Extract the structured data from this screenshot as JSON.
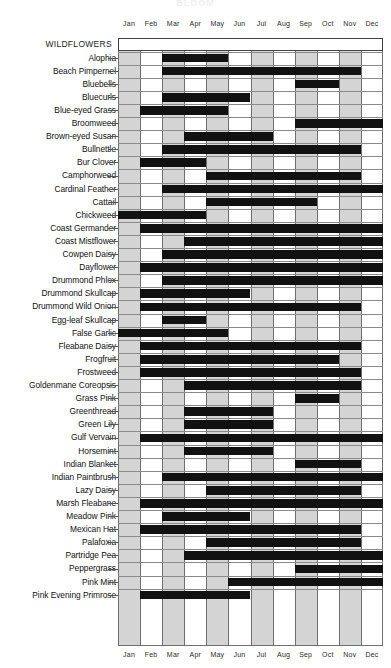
{
  "page": {
    "top_title": "BLOOM",
    "banner_label": "WILDFLOWERS"
  },
  "chart_data": {
    "type": "bar",
    "title": "WILDFLOWERS",
    "subtitle": "Bloom periods by month",
    "xlabel": "",
    "ylabel": "",
    "grid": true,
    "legend": "none",
    "categories": [
      "Jan",
      "Feb",
      "Mar",
      "Apr",
      "May",
      "Jun",
      "Jul",
      "Aug",
      "Sep",
      "Oct",
      "Nov",
      "Dec"
    ],
    "bar_meaning": "Black span = months in bloom",
    "series": [
      {
        "name": "Alophia",
        "start_month": "Mar",
        "end_month": "May",
        "start": 2,
        "end": 5
      },
      {
        "name": "Beach Pimpernel",
        "start_month": "Mar",
        "end_month": "Nov",
        "start": 2,
        "end": 11
      },
      {
        "name": "Bluebells",
        "start_month": "Sep",
        "end_month": "Oct",
        "start": 8,
        "end": 10
      },
      {
        "name": "Bluecurls",
        "start_month": "Mar",
        "end_month": "Jun",
        "start": 2,
        "end": 6
      },
      {
        "name": "Blue-eyed Grass",
        "start_month": "Feb",
        "end_month": "May",
        "start": 1,
        "end": 5
      },
      {
        "name": "Broomweed",
        "start_month": "Sep",
        "end_month": "Dec",
        "start": 8,
        "end": 12
      },
      {
        "name": "Brown-eyed Susan",
        "start_month": "Apr",
        "end_month": "Jul",
        "start": 3,
        "end": 7
      },
      {
        "name": "Bullnettle",
        "start_month": "Mar",
        "end_month": "Nov",
        "start": 2,
        "end": 11
      },
      {
        "name": "Bur Clover",
        "start_month": "Feb",
        "end_month": "Apr",
        "start": 1,
        "end": 4
      },
      {
        "name": "Camphorweed",
        "start_month": "May",
        "end_month": "Nov",
        "start": 4,
        "end": 11
      },
      {
        "name": "Cardinal Feather",
        "start_month": "Mar",
        "end_month": "Dec",
        "start": 2,
        "end": 12
      },
      {
        "name": "Cattail",
        "start_month": "May",
        "end_month": "Sep",
        "start": 4,
        "end": 9
      },
      {
        "name": "Chickweed",
        "start_month": "Jan",
        "end_month": "Apr",
        "start": 0,
        "end": 4
      },
      {
        "name": "Coast Germander",
        "start_month": "Feb",
        "end_month": "Dec",
        "start": 1,
        "end": 12
      },
      {
        "name": "Coast Mistflower",
        "start_month": "Apr",
        "end_month": "Dec",
        "start": 3,
        "end": 12
      },
      {
        "name": "Cowpen Daisy",
        "start_month": "Mar",
        "end_month": "Dec",
        "start": 2,
        "end": 12
      },
      {
        "name": "Dayflower",
        "start_month": "Feb",
        "end_month": "Dec",
        "start": 1,
        "end": 12
      },
      {
        "name": "Drummond Phlox",
        "start_month": "Mar",
        "end_month": "Dec",
        "start": 2,
        "end": 12
      },
      {
        "name": "Drummond Skullcap",
        "start_month": "Feb",
        "end_month": "Jun",
        "start": 1,
        "end": 6
      },
      {
        "name": "Drummond Wild Onion",
        "start_month": "Feb",
        "end_month": "Nov",
        "start": 1,
        "end": 11
      },
      {
        "name": "Egg-leaf Skullcap",
        "start_month": "Mar",
        "end_month": "Apr",
        "start": 2,
        "end": 4
      },
      {
        "name": "False Garlic",
        "start_month": "Jan",
        "end_month": "May",
        "start": 0,
        "end": 5
      },
      {
        "name": "Fleabane Daisy",
        "start_month": "Feb",
        "end_month": "Nov",
        "start": 1,
        "end": 11
      },
      {
        "name": "Frogfruit",
        "start_month": "Feb",
        "end_month": "Oct",
        "start": 1,
        "end": 10
      },
      {
        "name": "Frostweed",
        "start_month": "Feb",
        "end_month": "Nov",
        "start": 1,
        "end": 11
      },
      {
        "name": "Goldenmane Coreopsis",
        "start_month": "Apr",
        "end_month": "Nov",
        "start": 3,
        "end": 11
      },
      {
        "name": "Grass Pink",
        "start_month": "Sep",
        "end_month": "Oct",
        "start": 8,
        "end": 10
      },
      {
        "name": "Greenthread",
        "start_month": "Apr",
        "end_month": "Jul",
        "start": 3,
        "end": 7
      },
      {
        "name": "Green Lily",
        "start_month": "Apr",
        "end_month": "Jul",
        "start": 3,
        "end": 7
      },
      {
        "name": "Gulf Vervain",
        "start_month": "Feb",
        "end_month": "Dec",
        "start": 1,
        "end": 12
      },
      {
        "name": "Horsemint",
        "start_month": "Apr",
        "end_month": "Jul",
        "start": 3,
        "end": 7
      },
      {
        "name": "Indian Blanket",
        "start_month": "Sep",
        "end_month": "Nov",
        "start": 8,
        "end": 11
      },
      {
        "name": "Indian Paintbrush",
        "start_month": "Mar",
        "end_month": "Dec",
        "start": 2,
        "end": 12
      },
      {
        "name": "Lazy Daisy",
        "start_month": "May",
        "end_month": "Nov",
        "start": 4,
        "end": 11
      },
      {
        "name": "Marsh Fleabane",
        "start_month": "Feb",
        "end_month": "Dec",
        "start": 1,
        "end": 12
      },
      {
        "name": "Meadow Pink",
        "start_month": "Mar",
        "end_month": "Jun",
        "start": 2,
        "end": 6
      },
      {
        "name": "Mexican Hat",
        "start_month": "Feb",
        "end_month": "Nov",
        "start": 1,
        "end": 11
      },
      {
        "name": "Palafoxia",
        "start_month": "May",
        "end_month": "Nov",
        "start": 4,
        "end": 11
      },
      {
        "name": "Partridge Pea",
        "start_month": "Apr",
        "end_month": "Dec",
        "start": 3,
        "end": 12
      },
      {
        "name": "Peppergrass",
        "start_month": "Sep",
        "end_month": "Dec",
        "start": 8,
        "end": 12
      },
      {
        "name": "Pink Mint",
        "start_month": "Jun",
        "end_month": "Dec",
        "start": 5,
        "end": 12
      },
      {
        "name": "Pink Evening Primrose",
        "start_month": "Feb",
        "end_month": "Jun",
        "start": 1,
        "end": 6
      }
    ]
  }
}
